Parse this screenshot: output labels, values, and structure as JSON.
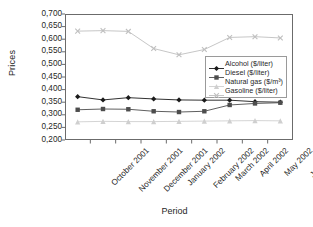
{
  "chart_data": {
    "type": "line",
    "title": "",
    "xlabel": "Period",
    "ylabel": "Prices",
    "categories": [
      "October 2001",
      "November 2001",
      "December 2001",
      "January 2002",
      "February 2002",
      "March 2002",
      "April 2002",
      "May 2002",
      "June 2002"
    ],
    "ylim": [
      0.2,
      0.7
    ],
    "ytick_labels": [
      "0,700",
      "0,650",
      "0,600",
      "0,550",
      "0,500",
      "0,450",
      "0,400",
      "0,350",
      "0,300",
      "0,250",
      "0,200"
    ],
    "ytick_values": [
      0.7,
      0.65,
      0.6,
      0.55,
      0.5,
      0.45,
      0.4,
      0.35,
      0.3,
      0.25,
      0.2
    ],
    "grid": false,
    "legend_position": "center-right",
    "series": [
      {
        "name": "Alcohol ($/liter)",
        "marker": "diamond",
        "color": "#1a1a1a",
        "values": [
          0.372,
          0.359,
          0.368,
          0.363,
          0.359,
          0.358,
          0.358,
          0.352,
          0.35
        ]
      },
      {
        "name": "Diesel ($/liter)",
        "marker": "square",
        "color": "#4d4d4d",
        "values": [
          0.32,
          0.323,
          0.322,
          0.314,
          0.311,
          0.314,
          0.339,
          0.345,
          0.348
        ]
      },
      {
        "name": "Natural gas ($/m³)",
        "marker": "triangle",
        "color": "#cfcfcf",
        "values": [
          0.272,
          0.274,
          0.273,
          0.273,
          0.274,
          0.275,
          0.276,
          0.277,
          0.276
        ]
      },
      {
        "name": "Gasoline ($/liter)",
        "marker": "cross",
        "color": "#bfbfbf",
        "values": [
          0.632,
          0.634,
          0.631,
          0.563,
          0.538,
          0.559,
          0.607,
          0.61,
          0.605
        ]
      }
    ]
  }
}
